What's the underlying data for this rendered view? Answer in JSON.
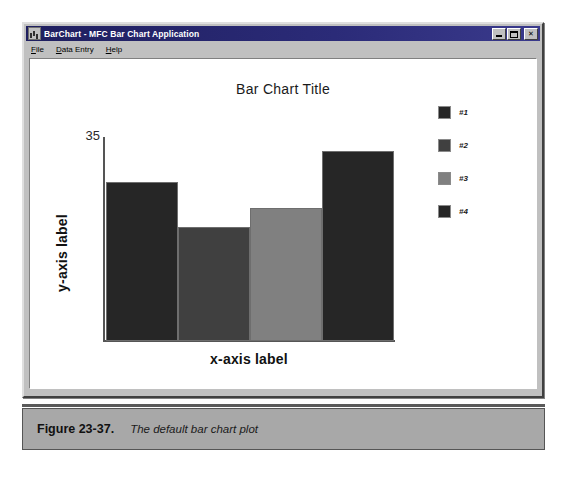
{
  "window": {
    "title": "BarChart - MFC Bar Chart Application",
    "icon": "app-chart-icon",
    "buttons": {
      "minimize": "minimize-icon",
      "maximize": "maximize-icon",
      "close": "close-icon"
    },
    "menu": [
      {
        "label": "File",
        "mnemonic": "F"
      },
      {
        "label": "Data Entry",
        "mnemonic": "D"
      },
      {
        "label": "Help",
        "mnemonic": "H"
      }
    ]
  },
  "cursor": {
    "icon": "arrow-cursor",
    "x": 360,
    "y": 381
  },
  "caption": {
    "number": "Figure 23-37.",
    "text": "The default bar chart plot"
  },
  "colors": {
    "bar1": "#262626",
    "bar2": "#404040",
    "bar3": "#808080",
    "bar4": "#262626",
    "axis": "#555555",
    "window_face": "#c0c0c0",
    "title_bar": "#27276e",
    "caption_band": "#a8a8a8",
    "plot_background": "#ffffff"
  },
  "chart_data": {
    "type": "bar",
    "title": "Bar Chart Title",
    "xlabel": "x-axis label",
    "ylabel": "y-axis label",
    "categories": [
      "#1",
      "#2",
      "#3",
      "#4"
    ],
    "values": [
      25,
      18,
      21,
      30
    ],
    "ylim": [
      0,
      35
    ],
    "yticks": [
      "35"
    ],
    "grid": false,
    "legend_position": "right",
    "series": [
      {
        "name": "default",
        "bars": [
          {
            "label": "#1",
            "value": 25,
            "color": "#262626"
          },
          {
            "label": "#2",
            "value": 18,
            "color": "#404040"
          },
          {
            "label": "#3",
            "value": 21,
            "color": "#808080"
          },
          {
            "label": "#4",
            "value": 30,
            "color": "#262626"
          }
        ]
      }
    ],
    "legend": [
      {
        "label": "#1",
        "color": "#262626"
      },
      {
        "label": "#2",
        "color": "#404040"
      },
      {
        "label": "#3",
        "color": "#808080"
      },
      {
        "label": "#4",
        "color": "#262626"
      }
    ]
  }
}
